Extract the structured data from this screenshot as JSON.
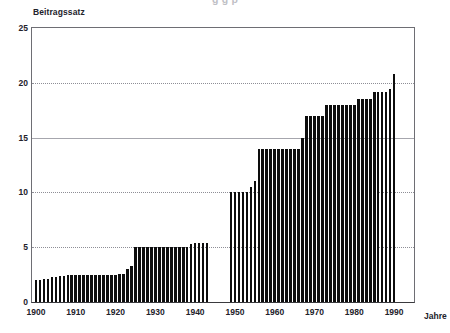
{
  "figure": {
    "clipped_heading": "g  g  p",
    "ylabel": "Beitragssatz",
    "xlabel": "Jahre"
  },
  "chart_data": {
    "type": "bar",
    "title": "",
    "xlabel": "Jahre",
    "ylabel": "Beitragssatz",
    "ylim": [
      0,
      25
    ],
    "xlim": [
      1899,
      1995
    ],
    "yticks": [
      0,
      5,
      10,
      15,
      20,
      25
    ],
    "xticks": [
      1900,
      1910,
      1920,
      1930,
      1940,
      1950,
      1960,
      1970,
      1980,
      1990
    ],
    "grid": "horizontal-dotted",
    "legend": "none",
    "bar_color": "#0d0d0d",
    "note_gap": "no bars between 1944 and 1948",
    "categories": [
      1900,
      1901,
      1902,
      1903,
      1904,
      1905,
      1906,
      1907,
      1908,
      1909,
      1910,
      1911,
      1912,
      1913,
      1914,
      1915,
      1916,
      1917,
      1918,
      1919,
      1920,
      1921,
      1922,
      1923,
      1924,
      1925,
      1926,
      1927,
      1928,
      1929,
      1930,
      1931,
      1932,
      1933,
      1934,
      1935,
      1936,
      1937,
      1938,
      1939,
      1940,
      1941,
      1942,
      1943,
      1949,
      1950,
      1951,
      1952,
      1953,
      1954,
      1955,
      1956,
      1957,
      1958,
      1959,
      1960,
      1961,
      1962,
      1963,
      1964,
      1965,
      1966,
      1967,
      1968,
      1969,
      1970,
      1971,
      1972,
      1973,
      1974,
      1975,
      1976,
      1977,
      1978,
      1979,
      1980,
      1981,
      1982,
      1983,
      1984,
      1985,
      1986,
      1987,
      1988,
      1989,
      1990
    ],
    "values": [
      2.0,
      2.0,
      2.1,
      2.1,
      2.3,
      2.3,
      2.4,
      2.4,
      2.5,
      2.5,
      2.5,
      2.5,
      2.5,
      2.5,
      2.5,
      2.5,
      2.5,
      2.5,
      2.5,
      2.5,
      2.5,
      2.6,
      2.6,
      3.0,
      3.3,
      5.0,
      5.0,
      5.0,
      5.0,
      5.0,
      5.0,
      5.0,
      5.0,
      5.0,
      5.0,
      5.0,
      5.0,
      5.0,
      5.0,
      5.3,
      5.4,
      5.4,
      5.4,
      5.4,
      10.0,
      10.0,
      10.0,
      10.0,
      10.0,
      10.5,
      11.0,
      14.0,
      14.0,
      14.0,
      14.0,
      14.0,
      14.0,
      14.0,
      14.0,
      14.0,
      14.0,
      14.0,
      15.0,
      17.0,
      17.0,
      17.0,
      17.0,
      17.0,
      18.0,
      18.0,
      18.0,
      18.0,
      18.0,
      18.0,
      18.0,
      18.0,
      18.5,
      18.5,
      18.5,
      18.5,
      19.2,
      19.2,
      19.2,
      19.2,
      19.4,
      20.8
    ]
  }
}
